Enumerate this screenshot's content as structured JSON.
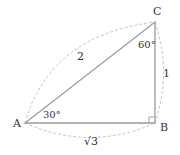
{
  "diagram": {
    "type": "right-triangle",
    "vertices": {
      "A": {
        "label": "A",
        "x": 25,
        "y": 123
      },
      "B": {
        "label": "B",
        "x": 155,
        "y": 123
      },
      "C": {
        "label": "C",
        "x": 155,
        "y": 22
      }
    },
    "sides": {
      "AC": {
        "label": "2"
      },
      "BC": {
        "label": "1"
      },
      "AB": {
        "label": "√3",
        "radicand": "3",
        "radical": "√"
      }
    },
    "angles": {
      "A": {
        "label": "30°"
      },
      "C": {
        "label": "60°"
      },
      "B": {
        "label": "right-angle"
      }
    },
    "colors": {
      "triangle": "#999999",
      "dashed_arc": "#bbbbbb",
      "text": "#333333"
    }
  }
}
